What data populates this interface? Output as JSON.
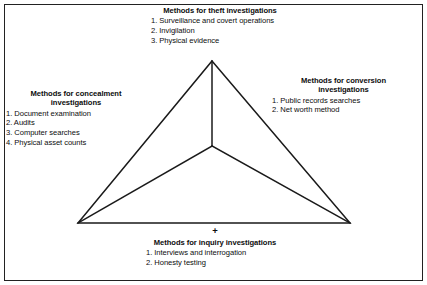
{
  "figure": {
    "plus_symbol": "+",
    "line_color": "#1a1a1a",
    "border_color": "#222222",
    "background_color": "#ffffff",
    "text_color": "#0d0d0d"
  },
  "blocks": {
    "theft": {
      "position": "top",
      "heading": "Methods for theft investigations",
      "items": [
        "1. Surveillance and covert operations",
        "2. Invigilation",
        "3. Physical evidence"
      ]
    },
    "concealment": {
      "position": "left",
      "heading_line1": "Methods for concealment",
      "heading_line2": "investigations",
      "items": [
        "1. Document examination",
        "2. Audits",
        "3. Computer searches",
        "4. Physical asset counts"
      ]
    },
    "conversion": {
      "position": "right",
      "heading_line1": "Methods for conversion",
      "heading_line2": "investigations",
      "items": [
        "1. Public records searches",
        "2. Net worth method"
      ]
    },
    "inquiry": {
      "position": "bottom",
      "heading": "Methods for inquiry investigations",
      "items": [
        "1. Interviews and interrogation",
        "2. Honesty testing"
      ]
    }
  },
  "diagram_geometry": {
    "apex": {
      "x": 212,
      "y": 61
    },
    "bottom_left": {
      "x": 78,
      "y": 223
    },
    "bottom_right": {
      "x": 350,
      "y": 223
    },
    "center": {
      "x": 212,
      "y": 146
    }
  }
}
